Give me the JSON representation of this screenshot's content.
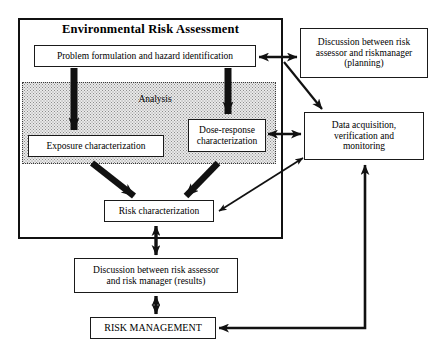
{
  "figure": {
    "background_color": "#ffffff",
    "line_color": "#111111",
    "shade_color": "#e9e9e9"
  },
  "container": {
    "label": "Environmental Risk Assessment"
  },
  "analysis_region": {
    "label": "Analysis"
  },
  "nodes": {
    "problem_formulation": "Problem formulation and hazard identification",
    "exposure_characterization": "Exposure characterization",
    "dose_response_characterization": "Dose-response\ncharacterization",
    "risk_characterization": "Risk characterization",
    "discussion_planning": "Discussion between risk\nassessor and riskmanager\n(planning)",
    "data_acquisition": "Data acquisition,\nverification and\nmonitoring",
    "discussion_results": "Discussion between risk assessor\nand risk manager (results)",
    "risk_management": "RISK MANAGEMENT"
  },
  "connectors": [
    {
      "name": "problem-to-exposure",
      "from": "problem_formulation",
      "to": "exposure_characterization",
      "style": "thick-solid",
      "direction": "one-way"
    },
    {
      "name": "problem-to-dose-response",
      "from": "problem_formulation",
      "to": "dose_response_characterization",
      "style": "thick-solid",
      "direction": "one-way"
    },
    {
      "name": "exposure-to-risk-characterization",
      "from": "exposure_characterization",
      "to": "risk_characterization",
      "style": "thick-solid",
      "direction": "one-way"
    },
    {
      "name": "dose-response-to-risk-characterization",
      "from": "dose_response_characterization",
      "to": "risk_characterization",
      "style": "thick-solid",
      "direction": "one-way"
    },
    {
      "name": "problem-formulation-to-discussion-planning",
      "from": "problem_formulation",
      "to": "discussion_planning",
      "style": "thin-solid",
      "direction": "two-way"
    },
    {
      "name": "discussion-planning-to-data-acquisition",
      "from": "discussion_planning",
      "to": "data_acquisition",
      "style": "thin-solid",
      "direction": "one-way"
    },
    {
      "name": "dose-response-to-data-acquisition",
      "from": "dose_response_characterization",
      "to": "data_acquisition",
      "style": "thin-solid",
      "direction": "two-way"
    },
    {
      "name": "risk-characterization-to-data-acquisition",
      "from": "risk_characterization",
      "to": "data_acquisition",
      "style": "thin-solid",
      "direction": "two-way"
    },
    {
      "name": "risk-characterization-to-discussion-results",
      "from": "risk_characterization",
      "to": "discussion_results",
      "style": "thick-solid",
      "direction": "two-way"
    },
    {
      "name": "discussion-results-to-risk-management",
      "from": "discussion_results",
      "to": "risk_management",
      "style": "thick-solid",
      "direction": "two-way"
    },
    {
      "name": "risk-management-to-data-acquisition",
      "from": "risk_management",
      "to": "data_acquisition",
      "style": "thin-solid",
      "direction": "one-way"
    }
  ]
}
